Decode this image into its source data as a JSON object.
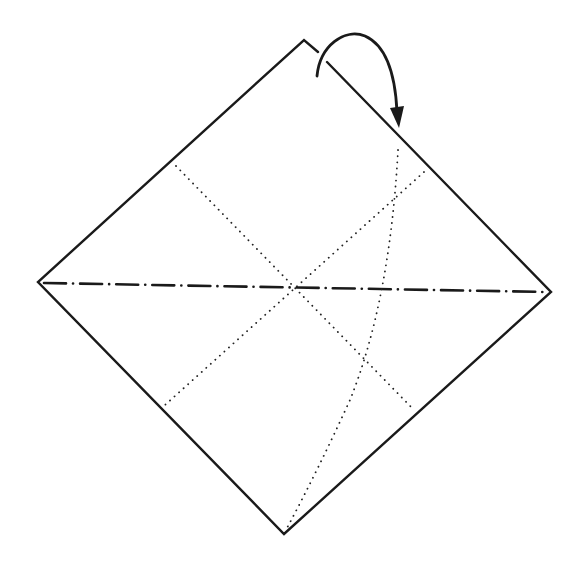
{
  "figure": {
    "colors": {
      "line": "#1a1a1a",
      "background": "#ffffff"
    },
    "shape": {
      "type": "diamond-square",
      "corners": {
        "top": [
          304,
          40
        ],
        "right": [
          551,
          292
        ],
        "bottom": [
          284,
          534
        ],
        "left": [
          38,
          282
        ]
      },
      "top_corner_break": {
        "from": [
          318,
          52
        ],
        "to": [
          327,
          62
        ]
      }
    },
    "creases": [
      {
        "name": "horizontal-diagonal",
        "style": "mountain-fold (dash-dot)",
        "from": [
          44,
          283
        ],
        "to": [
          546,
          292
        ]
      },
      {
        "name": "diagonal-upper-left-to-lower-right",
        "style": "valley-fold (dotted)",
        "from": [
          176,
          166
        ],
        "to": [
          414,
          410
        ]
      },
      {
        "name": "diagonal-upper-right-to-lower-left",
        "style": "valley-fold (dotted)",
        "from": [
          424,
          172
        ],
        "to": [
          165,
          405
        ]
      },
      {
        "name": "curved-guide",
        "style": "dotted curve",
        "from": [
          398,
          150
        ],
        "to": [
          287,
          528
        ]
      }
    ],
    "arrow": {
      "meaning": "fold the top corner down behind/over along the right edge",
      "start": [
        317,
        76
      ],
      "apex": [
        355,
        34
      ],
      "tip": [
        399,
        126
      ]
    }
  }
}
